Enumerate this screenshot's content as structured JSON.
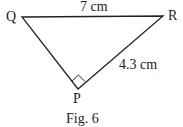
{
  "figure": {
    "caption": "Fig. 6",
    "shape": "right triangle",
    "vertices": {
      "Q": {
        "label": "Q",
        "x": 22,
        "y": 17
      },
      "R": {
        "label": "R",
        "x": 163,
        "y": 16
      },
      "P": {
        "label": "P",
        "x": 78,
        "y": 89
      }
    },
    "sides": {
      "QR": {
        "label": "7 cm"
      },
      "PR": {
        "label": "4.3 cm"
      }
    },
    "right_angle_at": "P",
    "colors": {
      "stroke": "#222222",
      "background": "#ffffff"
    }
  }
}
